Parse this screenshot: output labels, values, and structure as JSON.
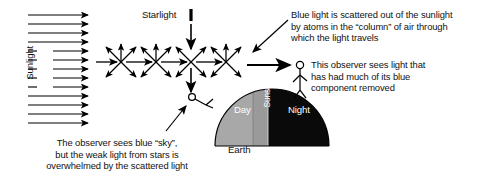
{
  "diagram": {
    "labels": {
      "sunlight": "Sunlight",
      "starlight": "Starlight",
      "earth": "Earth",
      "day": "Day",
      "night": "Night",
      "sunset": "Sunset"
    },
    "annotations": {
      "blue_scatter_note": "Blue light is scattered out of the sunlight\nby atoms in the “column” of air through\nwhich the light travels",
      "observer_note": "This observer sees light that\nhas had much of its blue\ncomponent removed",
      "bottom_note": "The observer sees blue “sky”,\nbut the weak light from stars is\noverwhelmed by the scattered light"
    },
    "colors": {
      "ink": "#000000",
      "day_fill": "#a8a8a8",
      "night_fill": "#0a0a0a",
      "sunset_fill": "#9a9a9a",
      "background": "#ffffff",
      "label_on_dark": "#ffffff"
    },
    "counts": {
      "sunlight_rays": 13,
      "scatter_nodes": 4
    }
  }
}
